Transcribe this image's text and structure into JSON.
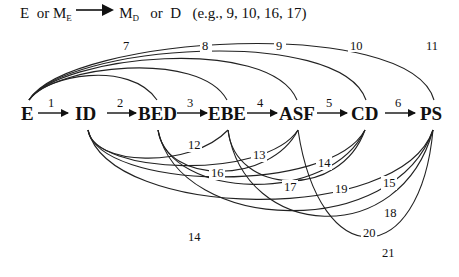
{
  "caption": {
    "source_a": "E",
    "or1": "or",
    "source_b_main": "M",
    "source_b_sub": "E",
    "target_a_main": "M",
    "target_a_sub": "D",
    "or2": "or",
    "target_b": "D",
    "examples": "(e.g., 9, 10, 16, 17)"
  },
  "nodes": [
    {
      "id": "E",
      "label": "E"
    },
    {
      "id": "ID",
      "label": "ID"
    },
    {
      "id": "BED",
      "label": "BED"
    },
    {
      "id": "EBE",
      "label": "EBE"
    },
    {
      "id": "ASF",
      "label": "ASF"
    },
    {
      "id": "CD",
      "label": "CD"
    },
    {
      "id": "PS",
      "label": "PS"
    }
  ],
  "sequential_edges": [
    {
      "num": "1",
      "from": "E",
      "to": "ID"
    },
    {
      "num": "2",
      "from": "ID",
      "to": "BED"
    },
    {
      "num": "3",
      "from": "BED",
      "to": "EBE"
    },
    {
      "num": "4",
      "from": "EBE",
      "to": "ASF"
    },
    {
      "num": "5",
      "from": "ASF",
      "to": "CD"
    },
    {
      "num": "6",
      "from": "CD",
      "to": "PS"
    }
  ],
  "upper_arcs": [
    {
      "num": "7",
      "from": "E",
      "to": "BED"
    },
    {
      "num": "8",
      "from": "E",
      "to": "EBE"
    },
    {
      "num": "9",
      "from": "E",
      "to": "ASF"
    },
    {
      "num": "10",
      "from": "E",
      "to": "CD"
    },
    {
      "num": "11",
      "from": "E",
      "to": "PS"
    }
  ],
  "lower_arcs": [
    {
      "num": "12",
      "from": "ID",
      "to": "EBE"
    },
    {
      "num": "13",
      "from": "ID",
      "to": "ASF"
    },
    {
      "num": "14",
      "from": "ID",
      "to": "CD"
    },
    {
      "num": "15",
      "from": "ID",
      "to": "PS"
    },
    {
      "num": "16",
      "from": "BED",
      "to": "ASF"
    },
    {
      "num": "17",
      "from": "BED",
      "to": "CD"
    },
    {
      "num": "18",
      "from": "BED",
      "to": "PS"
    },
    {
      "num": "19",
      "from": "EBE",
      "to": "CD"
    },
    {
      "num": "20",
      "from": "EBE",
      "to": "PS"
    },
    {
      "num": "21",
      "from": "ASF",
      "to": "PS"
    }
  ],
  "stray_label": "14"
}
